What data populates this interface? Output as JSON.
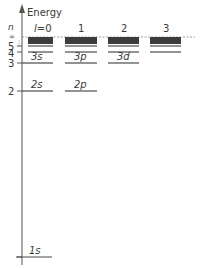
{
  "diagram": {
    "title": "Energy",
    "axis_label": "n",
    "infinity_label": "∞",
    "dots_label": "⋮",
    "columns": [
      {
        "l": "l=0",
        "l_display_prefix": "l",
        "l_display_value": "=0",
        "x1": 28,
        "x2": 53
      },
      {
        "l": "1",
        "x1": 65,
        "x2": 97
      },
      {
        "l": "2",
        "x1": 108,
        "x2": 139
      },
      {
        "l": "3",
        "x1": 150,
        "x2": 181
      }
    ],
    "n_levels": [
      {
        "n": "5",
        "y": 46
      },
      {
        "n": "4",
        "y": 52
      },
      {
        "n": "3",
        "y": 63
      },
      {
        "n": "2",
        "y": 91
      },
      {
        "n": "1",
        "y": 257
      }
    ],
    "orbital_labels": [
      {
        "text": "3s",
        "col": 0,
        "y": 63
      },
      {
        "text": "3p",
        "col": 1,
        "y": 63
      },
      {
        "text": "3d",
        "col": 2,
        "y": 63
      },
      {
        "text": "2s",
        "col": 0,
        "y": 91
      },
      {
        "text": "2p",
        "col": 1,
        "y": 91
      },
      {
        "text": "1s",
        "col": 0,
        "y": 257
      }
    ],
    "colors": {
      "line": "#4a4a4a",
      "dense_band": "#3c3c3c",
      "axis": "#555555",
      "text": "#3a3a3a",
      "dashed": "#888888"
    }
  }
}
